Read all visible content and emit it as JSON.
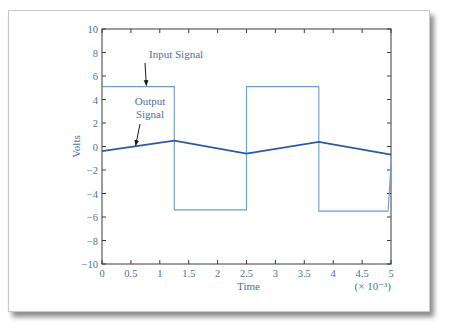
{
  "chart_data": {
    "type": "line",
    "title": "",
    "xlabel": "Time",
    "ylabel": "Volts",
    "x_multiplier_label": "(× 10⁻³)",
    "xlim": [
      0,
      5
    ],
    "ylim": [
      -10,
      10
    ],
    "x_ticks": [
      "0",
      "0.5",
      "1",
      "1.5",
      "2",
      "2.5",
      "3",
      "3.5",
      "4",
      "4.5",
      "5"
    ],
    "y_ticks": [
      "10",
      "8",
      "6",
      "4",
      "2",
      "0",
      "−2",
      "−4",
      "−6",
      "−8",
      "−10"
    ],
    "grid": false,
    "legend": null,
    "annotations": [
      {
        "text": "Input Signal",
        "points_to": [
          0.75,
          5.1
        ]
      },
      {
        "text": "Output Signal",
        "points_to": [
          0.6,
          0.0
        ]
      }
    ],
    "series": [
      {
        "name": "Input Signal",
        "color": "#6b9bd1",
        "x": [
          0,
          1.25,
          1.25,
          2.5,
          2.5,
          3.75,
          3.75,
          4.95,
          5.0
        ],
        "y": [
          5.1,
          5.1,
          -5.4,
          -5.4,
          5.1,
          5.1,
          -5.5,
          -5.5,
          -1.5
        ]
      },
      {
        "name": "Output Signal",
        "color": "#2c5aa0",
        "x": [
          0,
          1.25,
          2.5,
          3.75,
          5.0
        ],
        "y": [
          -0.4,
          0.5,
          -0.6,
          0.4,
          -0.7
        ]
      }
    ]
  }
}
